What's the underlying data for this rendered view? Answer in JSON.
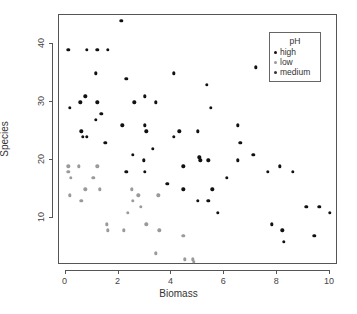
{
  "chart_data": {
    "type": "scatter",
    "title": "",
    "xlabel": "Biomass",
    "ylabel": "Species",
    "xlim": [
      -0.25,
      10.3
    ],
    "ylim": [
      2,
      45
    ],
    "xticks": [
      "0",
      "2",
      "4",
      "6",
      "8",
      "10"
    ],
    "xtick_values": [
      0,
      2,
      4,
      6,
      8,
      10
    ],
    "yticks": [
      "10",
      "20",
      "30",
      "40"
    ],
    "ytick_values": [
      10,
      20,
      30,
      40
    ],
    "grid": false,
    "legend": {
      "title": "pH",
      "position": "top-right",
      "entries": [
        {
          "label": "high",
          "color": "#111111"
        },
        {
          "label": "low",
          "color": "#9a9a9a"
        },
        {
          "label": "medium",
          "color": "#333333"
        }
      ]
    },
    "series": [
      {
        "name": "high",
        "color": "#111111",
        "points": [
          [
            0.1,
            39
          ],
          [
            0.15,
            29
          ],
          [
            0.55,
            30
          ],
          [
            0.75,
            31
          ],
          [
            0.6,
            25
          ],
          [
            0.65,
            24
          ],
          [
            0.8,
            24
          ],
          [
            0.8,
            39
          ],
          [
            1.2,
            39
          ],
          [
            1.15,
            35
          ],
          [
            1.2,
            30
          ],
          [
            1.15,
            27
          ],
          [
            1.35,
            28
          ],
          [
            1.5,
            23
          ],
          [
            1.6,
            39
          ],
          [
            2.1,
            44
          ],
          [
            2.15,
            26
          ],
          [
            2.3,
            34
          ],
          [
            2.6,
            30
          ],
          [
            2.3,
            18
          ],
          [
            3.0,
            31
          ],
          [
            3.0,
            26
          ],
          [
            3.05,
            25
          ],
          [
            3.4,
            30
          ],
          [
            3.0,
            18
          ],
          [
            2.95,
            20
          ],
          [
            2.55,
            21
          ],
          [
            3.3,
            22
          ],
          [
            4.1,
            35
          ],
          [
            4.1,
            24
          ],
          [
            4.3,
            25
          ],
          [
            5.0,
            25
          ],
          [
            5.35,
            33
          ],
          [
            5.1,
            20
          ],
          [
            5.4,
            20
          ],
          [
            5.05,
            20.5
          ],
          [
            5.5,
            29
          ],
          [
            4.45,
            19
          ],
          [
            4.45,
            15
          ],
          [
            5.0,
            13
          ],
          [
            5.4,
            13
          ],
          [
            5.55,
            15
          ],
          [
            6.1,
            17
          ],
          [
            5.75,
            11
          ],
          [
            6.5,
            26
          ],
          [
            6.6,
            23
          ],
          [
            6.5,
            20
          ],
          [
            7.1,
            21
          ],
          [
            7.2,
            36
          ],
          [
            7.65,
            18
          ],
          [
            8.1,
            19
          ],
          [
            8.6,
            18
          ],
          [
            7.8,
            9
          ],
          [
            8.2,
            8
          ],
          [
            8.25,
            6
          ],
          [
            9.1,
            12
          ],
          [
            9.4,
            7
          ],
          [
            9.6,
            12
          ],
          [
            10.0,
            11
          ],
          [
            3.85,
            16
          ]
        ]
      },
      {
        "name": "low",
        "color": "#9a9a9a",
        "points": [
          [
            0.1,
            18
          ],
          [
            0.1,
            19
          ],
          [
            0.2,
            17
          ],
          [
            0.15,
            14
          ],
          [
            0.5,
            19
          ],
          [
            0.6,
            13
          ],
          [
            0.75,
            15
          ],
          [
            1.05,
            17
          ],
          [
            1.2,
            19
          ],
          [
            1.3,
            15
          ],
          [
            1.55,
            9
          ],
          [
            1.6,
            8
          ],
          [
            2.2,
            8
          ],
          [
            2.35,
            11
          ],
          [
            2.5,
            15
          ],
          [
            2.55,
            13
          ],
          [
            2.75,
            14
          ],
          [
            2.85,
            12
          ],
          [
            3.05,
            9
          ],
          [
            3.5,
            14
          ],
          [
            3.55,
            8
          ],
          [
            3.4,
            4
          ],
          [
            4.5,
            3
          ],
          [
            4.45,
            7
          ],
          [
            4.8,
            3
          ],
          [
            4.85,
            2.5
          ]
        ]
      },
      {
        "name": "medium",
        "color": "#333333",
        "points": []
      }
    ]
  },
  "figure": {
    "background": "#ffffff",
    "frame_color": "#555555",
    "axis_text_color": "#444444"
  }
}
